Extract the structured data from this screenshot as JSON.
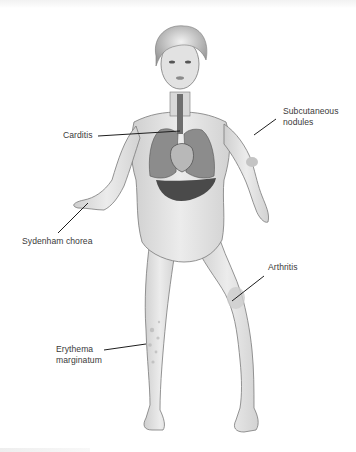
{
  "diagram": {
    "type": "anatomical-illustration",
    "style": "grayscale medical illustration with callout labels",
    "colors": {
      "background": "#ffffff",
      "skin_fill": "#e3e3e3",
      "skin_outline": "#7a7a7a",
      "organ_dark": "#4a4a4a",
      "lung_fill": "#8c8c8c",
      "heart_fill": "#b8b8b8",
      "label_text": "#3a3a3a",
      "leader_line": "#1e1e1e"
    },
    "labels": [
      {
        "id": "carditis",
        "text": "Carditis",
        "anchor": "heart"
      },
      {
        "id": "subcutaneous-nodules",
        "text": "Subcutaneous nodules",
        "line1": "Subcutaneous",
        "line2": "nodules",
        "anchor": "left elbow (figure's)"
      },
      {
        "id": "sydenham-chorea",
        "text": "Sydenham chorea",
        "anchor": "right hand (figure's)"
      },
      {
        "id": "arthritis",
        "text": "Arthritis",
        "anchor": "left knee (figure's)"
      },
      {
        "id": "erythema-marginatum",
        "text": "Erythema marginatum",
        "line1": "Erythema",
        "line2": "marginatum",
        "anchor": "right shin (figure's)"
      }
    ]
  }
}
